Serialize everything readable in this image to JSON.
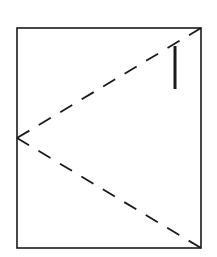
{
  "diagram": {
    "width": 217,
    "height": 257,
    "background": "#ffffff",
    "stroke_color": "#1a1a1a",
    "frame": {
      "x": 17,
      "y": 28,
      "width": 184,
      "height": 220,
      "stroke_width": 1.6
    },
    "dashed_lines": [
      {
        "x1": 201,
        "y1": 28,
        "x2": 17,
        "y2": 138,
        "dash": "14,11",
        "stroke_width": 1.8
      },
      {
        "x1": 17,
        "y1": 138,
        "x2": 201,
        "y2": 248,
        "dash": "14,11",
        "stroke_width": 1.8
      }
    ],
    "marker_bar": {
      "x1": 175,
      "y1": 46,
      "x2": 175,
      "y2": 89,
      "stroke_width": 3
    }
  }
}
